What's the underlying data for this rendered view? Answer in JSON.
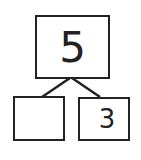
{
  "number_bond": {
    "whole": "5",
    "part_left": "",
    "part_right": "3"
  },
  "colors": {
    "stroke": "#222222",
    "background": "#ffffff"
  }
}
